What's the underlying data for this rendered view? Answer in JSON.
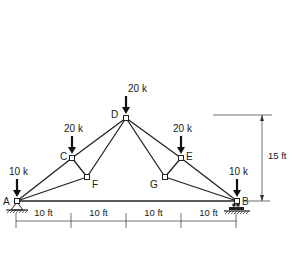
{
  "diagram": {
    "type": "truss",
    "nodes": [
      {
        "id": "A",
        "label": "A"
      },
      {
        "id": "B",
        "label": "B"
      },
      {
        "id": "C",
        "label": "C"
      },
      {
        "id": "D",
        "label": "D"
      },
      {
        "id": "E",
        "label": "E"
      },
      {
        "id": "F",
        "label": "F"
      },
      {
        "id": "G",
        "label": "G"
      }
    ],
    "members": [
      [
        "A",
        "B"
      ],
      [
        "A",
        "C"
      ],
      [
        "C",
        "D"
      ],
      [
        "D",
        "E"
      ],
      [
        "E",
        "B"
      ],
      [
        "A",
        "F"
      ],
      [
        "F",
        "D"
      ],
      [
        "C",
        "F"
      ],
      [
        "D",
        "G"
      ],
      [
        "G",
        "B"
      ],
      [
        "E",
        "G"
      ]
    ],
    "loads": [
      {
        "node": "A",
        "label": "10 k"
      },
      {
        "node": "C",
        "label": "20 k"
      },
      {
        "node": "D",
        "label": "20 k"
      },
      {
        "node": "E",
        "label": "20 k"
      },
      {
        "node": "B",
        "label": "10 k"
      }
    ],
    "supports": [
      {
        "node": "A",
        "kind": "pin"
      },
      {
        "node": "B",
        "kind": "roller"
      }
    ],
    "span_dimensions": [
      "10 ft",
      "10 ft",
      "10 ft",
      "10 ft"
    ],
    "height_dimension": "15 ft"
  }
}
